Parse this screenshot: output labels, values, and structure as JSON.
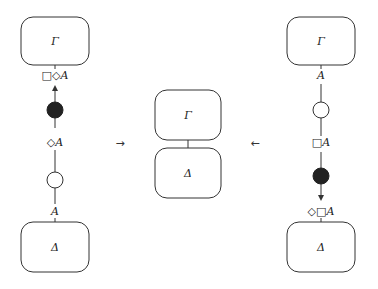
{
  "colors": {
    "stroke": "#333333",
    "filled_node": "#222222",
    "background": "#ffffff"
  },
  "left": {
    "top_box": "Γ",
    "bottom_box": "Δ",
    "label_top": "□◇A",
    "label_mid": "◇A",
    "label_bottom": "A",
    "nodes": [
      "filled",
      "open"
    ],
    "arrow_direction": "up"
  },
  "middle": {
    "top_box": "Γ",
    "bottom_box": "Δ"
  },
  "right": {
    "top_box": "Γ",
    "bottom_box": "Δ",
    "label_top": "A",
    "label_mid": "□A",
    "label_bottom": "◇□A",
    "nodes": [
      "open",
      "filled"
    ],
    "arrow_direction": "down"
  },
  "arrows": {
    "left_to_middle": "→",
    "right_to_middle": "←"
  }
}
